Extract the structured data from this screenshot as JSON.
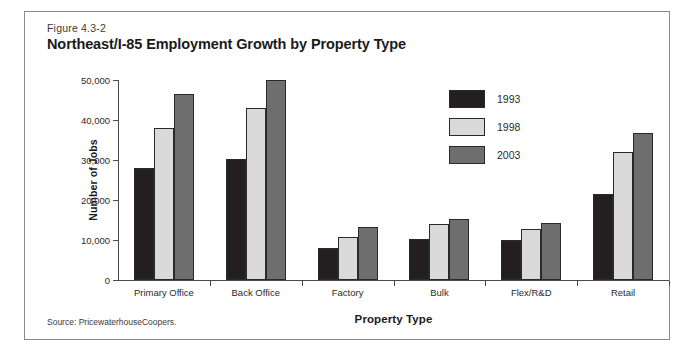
{
  "figure": {
    "number": "Figure 4.3-2",
    "title": "Northeast/I-85 Employment Growth by Property Type",
    "source": "Source: PricewaterhouseCoopers."
  },
  "chart_data": {
    "type": "bar",
    "title": "Northeast/I-85 Employment Growth by Property Type",
    "xlabel": "Property Type",
    "ylabel": "Number of Jobs",
    "ylim": [
      0,
      50000
    ],
    "yticks": [
      0,
      10000,
      20000,
      30000,
      40000,
      50000
    ],
    "ytick_labels": [
      "0",
      "10,000",
      "20,000",
      "30,000",
      "40,000",
      "50,000"
    ],
    "grid": false,
    "legend_position": "upper-right-inside",
    "categories": [
      "Primary Office",
      "Back Office",
      "Factory",
      "Bulk",
      "Flex/R&D",
      "Retail"
    ],
    "series": [
      {
        "name": "1993",
        "color": "#231f20",
        "values": [
          28000,
          30200,
          8000,
          10200,
          10000,
          21600
        ]
      },
      {
        "name": "1998",
        "color": "#d9d9d9",
        "values": [
          38000,
          43000,
          10800,
          14000,
          12800,
          32000
        ]
      },
      {
        "name": "2003",
        "color": "#6e6e6e",
        "values": [
          46500,
          50000,
          13200,
          15200,
          14200,
          36800
        ]
      }
    ]
  }
}
